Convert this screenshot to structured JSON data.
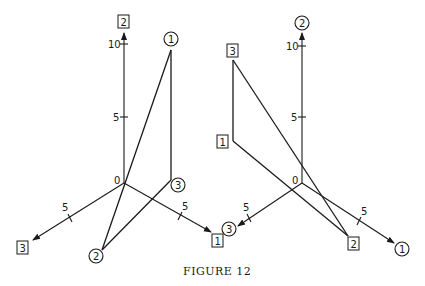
{
  "caption": "Figure 12",
  "caption_display": "FIGURE 12",
  "left_figure": {
    "origin_label": "0",
    "axes": [
      {
        "id": "vertical",
        "label": "2",
        "label_style": "square",
        "ticks": [
          "5",
          "10"
        ]
      },
      {
        "id": "lower-left",
        "label": "3",
        "label_style": "square",
        "ticks": [
          "5"
        ]
      },
      {
        "id": "lower-right",
        "label": "1",
        "label_style": "square",
        "ticks": [
          "5"
        ]
      }
    ],
    "points": [
      {
        "label": "1",
        "label_style": "circle"
      },
      {
        "label": "2",
        "label_style": "circle"
      },
      {
        "label": "3",
        "label_style": "circle"
      }
    ],
    "edges": [
      [
        "1",
        "3"
      ],
      [
        "3",
        "2"
      ],
      [
        "2",
        "1"
      ]
    ]
  },
  "right_figure": {
    "origin_label": "0",
    "axes": [
      {
        "id": "vertical",
        "label": "2",
        "label_style": "circle",
        "ticks": [
          "5",
          "10"
        ]
      },
      {
        "id": "lower-left",
        "label": "3",
        "label_style": "circle",
        "ticks": [
          "5"
        ]
      },
      {
        "id": "lower-right",
        "label": "1",
        "label_style": "circle",
        "ticks": [
          "5"
        ]
      }
    ],
    "points": [
      {
        "label": "3",
        "label_style": "square"
      },
      {
        "label": "1",
        "label_style": "square"
      },
      {
        "label": "2",
        "label_style": "square"
      }
    ],
    "edges": [
      [
        "3",
        "1"
      ],
      [
        "1",
        "2"
      ],
      [
        "2",
        "3"
      ]
    ]
  }
}
